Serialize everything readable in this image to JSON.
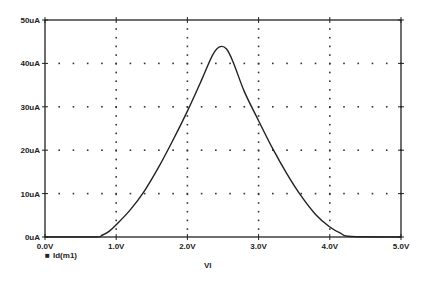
{
  "chart_data": {
    "type": "line",
    "title": "",
    "xlabel": "Vl",
    "ylabel": "",
    "xlim": [
      0,
      5
    ],
    "ylim": [
      0,
      50
    ],
    "x_ticks": [
      "0.0V",
      "1.0V",
      "2.0V",
      "3.0V",
      "4.0V",
      "5.0V"
    ],
    "y_ticks": [
      "0uA",
      "10uA",
      "20uA",
      "30uA",
      "40uA",
      "50uA"
    ],
    "grid": "dotted",
    "legend": {
      "position": "bottom-left",
      "entries": [
        "Id(m1)"
      ]
    },
    "series": [
      {
        "name": "Id(m1)",
        "x": [
          0,
          0.7,
          0.8,
          0.9,
          1.0,
          1.2,
          1.4,
          1.6,
          1.8,
          2.0,
          2.2,
          2.35,
          2.45,
          2.55,
          2.65,
          2.8,
          3.0,
          3.2,
          3.4,
          3.6,
          3.8,
          4.0,
          4.15,
          4.3,
          5.0
        ],
        "values": [
          0,
          0,
          0.4,
          1.3,
          2.8,
          6.3,
          10.7,
          16.2,
          22.4,
          29.0,
          36.2,
          41.8,
          43.8,
          43.3,
          40.0,
          33.5,
          26.8,
          20.3,
          14.5,
          9.4,
          5.2,
          2.3,
          0.9,
          0.1,
          0
        ]
      }
    ]
  },
  "legend": {
    "marker": "■",
    "label": "Id(m1)"
  },
  "axis": {
    "xlabel": "Vl"
  }
}
